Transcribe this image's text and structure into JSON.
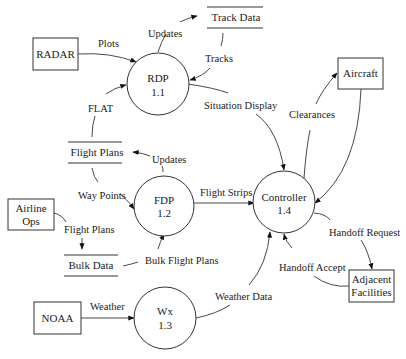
{
  "diagram": {
    "type": "data-flow-diagram",
    "entities": [
      {
        "id": "radar",
        "label": "RADAR"
      },
      {
        "id": "aircraft",
        "label": "Aircraft"
      },
      {
        "id": "airline",
        "label_line1": "Airline",
        "label_line2": "Ops"
      },
      {
        "id": "noaa",
        "label": "NOAA"
      },
      {
        "id": "adjacent",
        "label_line1": "Adjacent",
        "label_line2": "Facilities"
      }
    ],
    "processes": [
      {
        "id": "rdp",
        "name": "RDP",
        "number": "1.1"
      },
      {
        "id": "fdp",
        "name": "FDP",
        "number": "1.2"
      },
      {
        "id": "wx",
        "name": "Wx",
        "number": "1.3"
      },
      {
        "id": "controller",
        "name": "Controller",
        "number": "1.4"
      }
    ],
    "stores": [
      {
        "id": "track",
        "label": "Track Data"
      },
      {
        "id": "flightplans",
        "label": "Flight Plans"
      },
      {
        "id": "bulk",
        "label": "Bulk Data"
      }
    ],
    "flows": [
      {
        "label": "Plots",
        "from": "RADAR",
        "to": "RDP"
      },
      {
        "label": "Updates",
        "from": "RDP",
        "to": "Track Data"
      },
      {
        "label": "Tracks",
        "from": "Track Data",
        "to": "RDP"
      },
      {
        "label": "FLAT",
        "from": "Flight Plans",
        "to": "RDP"
      },
      {
        "label": "Situation Display",
        "from": "RDP",
        "to": "Controller"
      },
      {
        "label": "Updates",
        "from": "FDP",
        "to": "Flight Plans"
      },
      {
        "label": "Way Points",
        "from": "Flight Plans",
        "to": "FDP"
      },
      {
        "label": "Flight Strips",
        "from": "FDP",
        "to": "Controller"
      },
      {
        "label": "Flight Plans",
        "from": "Airline Ops",
        "to": "Bulk Data"
      },
      {
        "label": "Bulk Flight Plans",
        "from": "Bulk Data",
        "to": "FDP"
      },
      {
        "label": "Weather",
        "from": "NOAA",
        "to": "Wx"
      },
      {
        "label": "Weather Data",
        "from": "Wx",
        "to": "Controller"
      },
      {
        "label": "Clearances",
        "from": "Controller",
        "to": "Aircraft"
      },
      {
        "label": "",
        "from": "Aircraft",
        "to": "Controller"
      },
      {
        "label": "Handoff Request",
        "from": "Controller",
        "to": "Adjacent Facilities"
      },
      {
        "label": "Handoff Accept",
        "from": "Adjacent Facilities",
        "to": "Controller"
      }
    ]
  }
}
